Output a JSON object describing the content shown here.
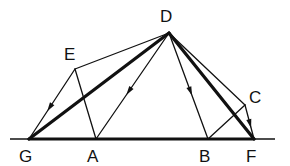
{
  "diagram": {
    "type": "geometric-construction",
    "colors": {
      "stroke": "#111111",
      "background": "#ffffff"
    },
    "points": {
      "D": {
        "x": 169,
        "y": 33,
        "label": "D",
        "label_x": 160,
        "label_y": 22
      },
      "E": {
        "x": 75,
        "y": 69,
        "label": "E",
        "label_x": 64,
        "label_y": 60
      },
      "C": {
        "x": 245,
        "y": 105,
        "label": "C",
        "label_x": 249,
        "label_y": 103
      },
      "G": {
        "x": 29,
        "y": 139,
        "label": "G",
        "label_x": 19,
        "label_y": 162
      },
      "A": {
        "x": 96,
        "y": 139,
        "label": "A",
        "label_x": 87,
        "label_y": 162
      },
      "B": {
        "x": 208,
        "y": 139,
        "label": "B",
        "label_x": 199,
        "label_y": 162
      },
      "F": {
        "x": 254,
        "y": 139,
        "label": "F",
        "label_x": 246,
        "label_y": 162
      }
    },
    "labels": [
      "D",
      "E",
      "C",
      "G",
      "A",
      "B",
      "F"
    ],
    "baseline": {
      "x1": 10,
      "x2": 275,
      "y": 139
    },
    "segments": [
      {
        "from": "G",
        "to": "F",
        "weight": "thick",
        "arrow": false
      },
      {
        "from": "D",
        "to": "G",
        "weight": "thick",
        "arrow": false
      },
      {
        "from": "D",
        "to": "F",
        "weight": "thick",
        "arrow": false
      },
      {
        "from": "D",
        "to": "E",
        "weight": "thin",
        "arrow": false
      },
      {
        "from": "E",
        "to": "G",
        "weight": "thin",
        "arrow": true
      },
      {
        "from": "E",
        "to": "A",
        "weight": "thin",
        "arrow": false
      },
      {
        "from": "D",
        "to": "A",
        "weight": "thin",
        "arrow": true
      },
      {
        "from": "D",
        "to": "B",
        "weight": "thin",
        "arrow": true
      },
      {
        "from": "D",
        "to": "C",
        "weight": "thin",
        "arrow": false
      },
      {
        "from": "C",
        "to": "F",
        "weight": "thin",
        "arrow": true
      },
      {
        "from": "C",
        "to": "B",
        "weight": "thin",
        "arrow": false
      }
    ]
  }
}
